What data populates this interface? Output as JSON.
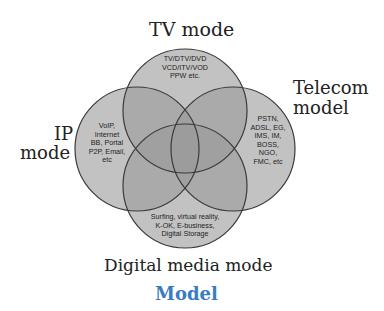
{
  "diagram": {
    "type": "venn",
    "caption": "Model",
    "circles": [
      {
        "id": "tv",
        "label": "TV mode",
        "content": "TV/DTV/DVD\nVCD/ITV/VOD\nPPW etc."
      },
      {
        "id": "ip",
        "label_line1": "IP",
        "label_line2": "mode",
        "content": "VoIP,\nInternet\nBB, Portal\nP2P, Email,\netc"
      },
      {
        "id": "telecom",
        "label_line1": "Telecom",
        "label_line2": "model",
        "content": "PSTN,\nADSL, EG,\nIMS, IM,\nBOSS,\nNGO,\nFMC, etc"
      },
      {
        "id": "digital",
        "label": "Digital media mode",
        "content": "Surfing, virtual reality,\nK-OK, E-business,\nDigital Storage"
      }
    ],
    "colors": {
      "circle_fill": "#9a9a9a",
      "circle_stroke": "#3a3a3a",
      "caption": "#3a7cc4",
      "background": "#ffffff"
    }
  }
}
